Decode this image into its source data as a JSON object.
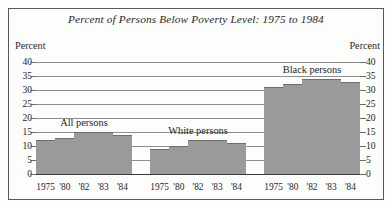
{
  "figure": {
    "title": "Percent of Persons Below Poverty Level: 1975 to 1984",
    "axis_caption_left": "Percent",
    "axis_caption_right": "Percent",
    "frame_color": "#595959",
    "bar_color": "#9a9a9a",
    "grid_color": "#8e8e8e"
  },
  "chart_data": {
    "type": "bar",
    "title": "Percent of Persons Below Poverty Level: 1975 to 1984",
    "xlabel": "",
    "ylabel": "Percent",
    "ylim": [
      0,
      40
    ],
    "yticks": [
      0,
      5,
      10,
      15,
      20,
      25,
      30,
      35,
      40
    ],
    "ytick_labels": [
      "0",
      "5",
      "10",
      "15",
      "20",
      "25",
      "30",
      "35",
      "40"
    ],
    "grid": true,
    "grid_axis": "y",
    "legend": "none",
    "dual_y_axis": true,
    "categories": [
      "1975",
      "'80",
      "'82",
      "'83",
      "'84"
    ],
    "groups": [
      {
        "name": "All persons",
        "label": "All persons",
        "values": [
          12,
          13,
          15,
          15,
          14
        ]
      },
      {
        "name": "White persons",
        "label": "White persons",
        "values": [
          9,
          10,
          12,
          12,
          11
        ]
      },
      {
        "name": "Black persons",
        "label": "Black persons",
        "values": [
          31,
          32,
          34,
          34,
          33
        ]
      }
    ]
  }
}
